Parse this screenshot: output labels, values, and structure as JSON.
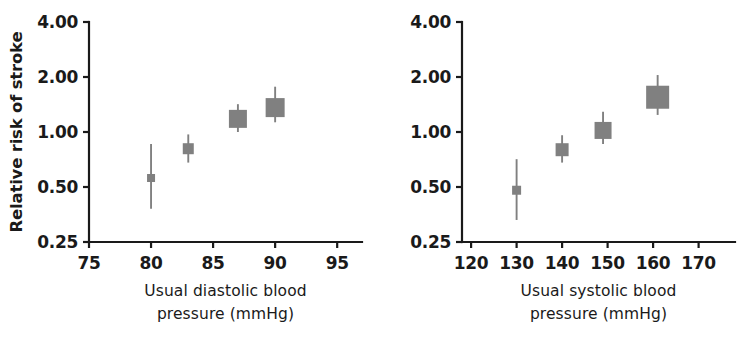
{
  "figure": {
    "background_color": "#ffffff",
    "marker_color": "#808080",
    "axis_color": "#1a1a1a",
    "text_color": "#1a1a1a"
  },
  "chart_data": [
    {
      "type": "scatter",
      "panel_id": "diastolic",
      "title": "",
      "xlabel": "Usual diastolic blood pressure (mmHg)",
      "xlabel_line1": "Usual diastolic blood",
      "xlabel_line2": "pressure (mmHg)",
      "ylabel": "Relative risk of stroke",
      "yscale": "log",
      "ylim": [
        0.25,
        4.0
      ],
      "xlim": [
        75,
        97
      ],
      "grid": false,
      "legend": "none",
      "xticks": [
        75,
        80,
        85,
        90,
        95
      ],
      "xticklabels": [
        "75",
        "80",
        "85",
        "90",
        "95"
      ],
      "yticks": [
        0.25,
        0.5,
        1.0,
        2.0,
        4.0
      ],
      "yticklabels": [
        "0.25",
        "0.50",
        "1.00",
        "2.00",
        "4.00"
      ],
      "x": [
        80,
        83,
        87,
        90
      ],
      "values": [
        0.56,
        0.81,
        1.18,
        1.36
      ],
      "ci_low": [
        0.38,
        0.68,
        1.0,
        1.13
      ],
      "ci_high": [
        0.86,
        0.97,
        1.42,
        1.77
      ],
      "marker_size": [
        8,
        11,
        18,
        19
      ]
    },
    {
      "type": "scatter",
      "panel_id": "systolic",
      "title": "",
      "xlabel": "Usual systolic blood pressure (mmHg)",
      "xlabel_line1": "Usual systolic blood",
      "xlabel_line2": "pressure (mmHg)",
      "ylabel": "Relative risk of stroke",
      "yscale": "log",
      "ylim": [
        0.25,
        4.0
      ],
      "xlim": [
        118,
        178
      ],
      "grid": false,
      "legend": "none",
      "xticks": [
        120,
        130,
        140,
        150,
        160,
        170
      ],
      "xticklabels": [
        "120",
        "130",
        "140",
        "150",
        "160",
        "170"
      ],
      "yticks": [
        0.25,
        0.5,
        1.0,
        2.0,
        4.0
      ],
      "yticklabels": [
        "0.25",
        "0.50",
        "1.00",
        "2.00",
        "4.00"
      ],
      "x": [
        130,
        140,
        149,
        161
      ],
      "values": [
        0.48,
        0.8,
        1.02,
        1.55
      ],
      "ci_low": [
        0.33,
        0.68,
        0.86,
        1.24
      ],
      "ci_high": [
        0.71,
        0.96,
        1.29,
        2.05
      ],
      "marker_size": [
        9,
        13,
        17,
        23
      ]
    }
  ]
}
